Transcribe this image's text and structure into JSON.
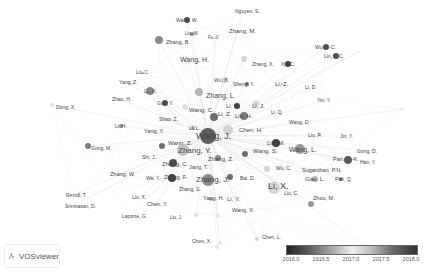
{
  "app": {
    "brand": "VOSviewer",
    "brand_icon": "vosviewer-logo-icon"
  },
  "legend": {
    "type": "overlay-color-scale",
    "ticks": [
      "2016.0",
      "2016.5",
      "2017.0",
      "2017.5",
      "2018.0"
    ],
    "colors": {
      "start": "#222222",
      "mid": "#eeeeee",
      "end": "#333333"
    }
  },
  "network": {
    "nodes": [
      {
        "label": "Nguyen, S.",
        "x": 230,
        "y": 11,
        "lx": 235,
        "ly": 11,
        "r": 0,
        "fs": 5,
        "c": "#999"
      },
      {
        "label": "Wang, W.",
        "x": 187,
        "y": 20,
        "lx": 176,
        "ly": 20,
        "r": 3,
        "fs": 5,
        "c": "#333"
      },
      {
        "label": "Zhang, M.",
        "x": 0,
        "y": 0,
        "lx": 229,
        "ly": 31,
        "r": 0,
        "fs": 6,
        "c": "#999"
      },
      {
        "label": "Liu, W.",
        "x": 192,
        "y": 34,
        "lx": 185,
        "ly": 34,
        "r": 2,
        "fs": 4.5,
        "c": "#777"
      },
      {
        "label": "Fu, Y.",
        "x": 216,
        "y": 38,
        "lx": 208,
        "ly": 38,
        "r": 1,
        "fs": 4.5,
        "c": "#999"
      },
      {
        "label": "Zhang, B.",
        "x": 159,
        "y": 40,
        "lx": 166,
        "ly": 43,
        "r": 4,
        "fs": 5.5,
        "c": "#777"
      },
      {
        "label": "Wang, H.",
        "x": 0,
        "y": 0,
        "lx": 180,
        "ly": 59,
        "r": 0,
        "fs": 7,
        "c": "#999"
      },
      {
        "label": "Wu, J.-C.",
        "x": 326,
        "y": 47,
        "lx": 315,
        "ly": 47,
        "r": 3,
        "fs": 5,
        "c": "#333"
      },
      {
        "label": "Lin, Y.-C.",
        "x": 336,
        "y": 56,
        "lx": 324,
        "ly": 56,
        "r": 3,
        "fs": 5,
        "c": "#333"
      },
      {
        "label": "Zhang, X.",
        "x": 244,
        "y": 59,
        "lx": 252,
        "ly": 64,
        "r": 3,
        "fs": 5,
        "c": "#ccc"
      },
      {
        "label": "Xu, C.",
        "x": 288,
        "y": 64,
        "lx": 281,
        "ly": 64,
        "r": 3,
        "fs": 5,
        "c": "#222"
      },
      {
        "label": "Liu, C.",
        "x": 143,
        "y": 73,
        "lx": 136,
        "ly": 73,
        "r": 1,
        "fs": 4.5,
        "c": "#999"
      },
      {
        "label": "Yang, Z.",
        "x": 0,
        "y": 0,
        "lx": 119,
        "ly": 82,
        "r": 0,
        "fs": 5,
        "c": "#999"
      },
      {
        "label": "Wu, X.",
        "x": 225,
        "y": 80,
        "lx": 214,
        "ly": 80,
        "r": 3,
        "fs": 5,
        "c": "#ccc"
      },
      {
        "label": "Sheng, Y.",
        "x": 247,
        "y": 84,
        "lx": 233,
        "ly": 84,
        "r": 2,
        "fs": 5,
        "c": "#555"
      },
      {
        "label": "Li, Z.",
        "x": 282,
        "y": 84,
        "lx": 275,
        "ly": 84,
        "r": 1,
        "fs": 6,
        "c": "#999"
      },
      {
        "label": "Li, D.",
        "x": 0,
        "y": 0,
        "lx": 305,
        "ly": 87,
        "r": 0,
        "fs": 5,
        "c": "#999"
      },
      {
        "label": "Li, K.",
        "x": 150,
        "y": 91,
        "lx": 144,
        "ly": 91,
        "r": 4,
        "fs": 6,
        "c": "#777"
      },
      {
        "label": "Zhang, L.",
        "x": 199,
        "y": 92,
        "lx": 206,
        "ly": 95,
        "r": 4,
        "fs": 7,
        "c": "#aaa"
      },
      {
        "label": "Zhao, H.",
        "x": 0,
        "y": 0,
        "lx": 112,
        "ly": 99,
        "r": 0,
        "fs": 5,
        "c": "#999"
      },
      {
        "label": "Dong, X.",
        "x": 52,
        "y": 105,
        "lx": 56,
        "ly": 107,
        "r": 2,
        "fs": 5,
        "c": "#ddd"
      },
      {
        "label": "Guo, Y.",
        "x": 165,
        "y": 103,
        "lx": 157,
        "ly": 103,
        "r": 3,
        "fs": 5,
        "c": "#333"
      },
      {
        "label": "Yin, Y.",
        "x": 0,
        "y": 0,
        "lx": 317,
        "ly": 100,
        "r": 0,
        "fs": 5,
        "c": "#999"
      },
      {
        "label": "Wang, C.",
        "x": 185,
        "y": 107,
        "lx": 189,
        "ly": 110,
        "r": 3,
        "fs": 6,
        "c": "#ddd"
      },
      {
        "label": "Li, X.",
        "x": 237,
        "y": 106,
        "lx": 226,
        "ly": 106,
        "r": 3,
        "fs": 6,
        "c": "#222"
      },
      {
        "label": "Li, J.",
        "x": 256,
        "y": 104,
        "lx": 252,
        "ly": 106,
        "r": 3,
        "fs": 6,
        "c": "#ccc"
      },
      {
        "label": "Li, Z.",
        "x": 214,
        "y": 117,
        "lx": 218,
        "ly": 114,
        "r": 4,
        "fs": 6,
        "c": "#555"
      },
      {
        "label": "Liu, H.",
        "x": 244,
        "y": 116,
        "lx": 235,
        "ly": 116,
        "r": 4,
        "fs": 6,
        "c": "#666"
      },
      {
        "label": "Li, Q.",
        "x": 0,
        "y": 0,
        "lx": 271,
        "ly": 112,
        "r": 0,
        "fs": 5,
        "c": "#999"
      },
      {
        "label": "Shao, Z.",
        "x": 0,
        "y": 0,
        "lx": 159,
        "ly": 119,
        "r": 0,
        "fs": 5,
        "c": "#999"
      },
      {
        "label": "Li, H.",
        "x": 121,
        "y": 126,
        "lx": 115,
        "ly": 126,
        "r": 2,
        "fs": 5,
        "c": "#777"
      },
      {
        "label": "Wang, D.",
        "x": 0,
        "y": 0,
        "lx": 289,
        "ly": 122,
        "r": 0,
        "fs": 5,
        "c": "#999"
      },
      {
        "label": "Li, L.",
        "x": 193,
        "y": 128,
        "lx": 189,
        "ly": 128,
        "r": 2,
        "fs": 5,
        "c": "#999"
      },
      {
        "label": "Chen, H.",
        "x": 228,
        "y": 130,
        "lx": 239,
        "ly": 130,
        "r": 5,
        "fs": 6,
        "c": "#ccc"
      },
      {
        "label": "Wang, J.",
        "x": 208,
        "y": 136,
        "lx": 196,
        "ly": 136,
        "r": 8,
        "fs": 9,
        "c": "#444"
      },
      {
        "label": "Yang, Y.",
        "x": 0,
        "y": 0,
        "lx": 144,
        "ly": 132,
        "r": 0,
        "fs": 5.5,
        "c": "#999"
      },
      {
        "label": "Liu, F.",
        "x": 320,
        "y": 135,
        "lx": 308,
        "ly": 135,
        "r": 1,
        "fs": 5,
        "c": "#999"
      },
      {
        "label": "Jin, Y.",
        "x": 0,
        "y": 0,
        "lx": 340,
        "ly": 136,
        "r": 0,
        "fs": 5,
        "c": "#999"
      },
      {
        "label": "Wang, Z.",
        "x": 162,
        "y": 146,
        "lx": 168,
        "ly": 143,
        "r": 3,
        "fs": 6,
        "c": "#555"
      },
      {
        "label": "Liu, M.",
        "x": 276,
        "y": 143,
        "lx": 267,
        "ly": 143,
        "r": 4,
        "fs": 6,
        "c": "#222"
      },
      {
        "label": "Gong, M.",
        "x": 88,
        "y": 146,
        "lx": 91,
        "ly": 148,
        "r": 3,
        "fs": 5,
        "c": "#666"
      },
      {
        "label": "Wang, L.",
        "x": 300,
        "y": 149,
        "lx": 289,
        "ly": 149,
        "r": 5,
        "fs": 7,
        "c": "#888"
      },
      {
        "label": "Zhang, Y.",
        "x": 183,
        "y": 150,
        "lx": 178,
        "ly": 151,
        "r": 6,
        "fs": 8,
        "c": "#bbb"
      },
      {
        "label": "Wang, S.",
        "x": 245,
        "y": 154,
        "lx": 253,
        "ly": 151,
        "r": 3,
        "fs": 6,
        "c": "#555"
      },
      {
        "label": "Gong, D.",
        "x": 0,
        "y": 0,
        "lx": 357,
        "ly": 151,
        "r": 0,
        "fs": 5,
        "c": "#999"
      },
      {
        "label": "Shi, J.",
        "x": 0,
        "y": 0,
        "lx": 142,
        "ly": 157,
        "r": 0,
        "fs": 5,
        "c": "#999"
      },
      {
        "label": "Pan, Q.-K.",
        "x": 348,
        "y": 160,
        "lx": 333,
        "ly": 160,
        "r": 4,
        "fs": 5.5,
        "c": "#444"
      },
      {
        "label": "Han, Y.",
        "x": 0,
        "y": 0,
        "lx": 360,
        "ly": 162,
        "r": 0,
        "fs": 5,
        "c": "#999"
      },
      {
        "label": "Zhang, Z.",
        "x": 218,
        "y": 158,
        "lx": 208,
        "ly": 159,
        "r": 3,
        "fs": 6,
        "c": "#777"
      },
      {
        "label": "Zhang, C.",
        "x": 173,
        "y": 163,
        "lx": 162,
        "ly": 164,
        "r": 4,
        "fs": 6,
        "c": "#333"
      },
      {
        "label": "Jiang, T.",
        "x": 0,
        "y": 0,
        "lx": 189,
        "ly": 167,
        "r": 0,
        "fs": 5,
        "c": "#999"
      },
      {
        "label": "Wu, C.",
        "x": 267,
        "y": 169,
        "lx": 276,
        "ly": 168,
        "r": 3,
        "fs": 5,
        "c": "#ccc"
      },
      {
        "label": "Suganthan, P.N.",
        "x": 0,
        "y": 0,
        "lx": 302,
        "ly": 171,
        "r": 0,
        "fs": 5.5,
        "c": "#999"
      },
      {
        "label": "Zhang, W.",
        "x": 0,
        "y": 0,
        "lx": 110,
        "ly": 175,
        "r": 0,
        "fs": 5.5,
        "c": "#999"
      },
      {
        "label": "Wu, Y.",
        "x": 152,
        "y": 178,
        "lx": 146,
        "ly": 178,
        "r": 1,
        "fs": 5,
        "c": "#999"
      },
      {
        "label": "Zhang, F.",
        "x": 172,
        "y": 178,
        "lx": 164,
        "ly": 178,
        "r": 4,
        "fs": 5.5,
        "c": "#222"
      },
      {
        "label": "Gao, L.",
        "x": 315,
        "y": 179,
        "lx": 305,
        "ly": 179,
        "r": 3,
        "fs": 6,
        "c": "#aaa"
      },
      {
        "label": "Pan, Q.",
        "x": 341,
        "y": 179,
        "lx": 335,
        "ly": 179,
        "r": 2,
        "fs": 5,
        "c": "#777"
      },
      {
        "label": "Zhang, J.",
        "x": 208,
        "y": 180,
        "lx": 196,
        "ly": 180,
        "r": 6,
        "fs": 8,
        "c": "#777"
      },
      {
        "label": "Bai, D.",
        "x": 230,
        "y": 177,
        "lx": 240,
        "ly": 178,
        "r": 3,
        "fs": 5,
        "c": "#555"
      },
      {
        "label": "Li, X.",
        "x": 274,
        "y": 188,
        "lx": 268,
        "ly": 186,
        "r": 6,
        "fs": 9,
        "c": "#ccc"
      },
      {
        "label": "Zhang, S.",
        "x": 0,
        "y": 0,
        "lx": 179,
        "ly": 189,
        "r": 0,
        "fs": 5,
        "c": "#999"
      },
      {
        "label": "Liu, C.",
        "x": 0,
        "y": 0,
        "lx": 284,
        "ly": 193,
        "r": 0,
        "fs": 5,
        "c": "#999"
      },
      {
        "label": "Reindl, T.",
        "x": 0,
        "y": 0,
        "lx": 66,
        "ly": 195,
        "r": 0,
        "fs": 5,
        "c": "#999"
      },
      {
        "label": "Liu, X.",
        "x": 0,
        "y": 0,
        "lx": 132,
        "ly": 197,
        "r": 0,
        "fs": 5,
        "c": "#999"
      },
      {
        "label": "Yang, H.",
        "x": 211,
        "y": 199,
        "lx": 203,
        "ly": 199,
        "r": 2,
        "fs": 5.5,
        "c": "#999"
      },
      {
        "label": "Li, Y.",
        "x": 0,
        "y": 0,
        "lx": 227,
        "ly": 199,
        "r": 0,
        "fs": 6,
        "c": "#999"
      },
      {
        "label": "Zhou, M.",
        "x": 311,
        "y": 204,
        "lx": 313,
        "ly": 199,
        "r": 3,
        "fs": 5.5,
        "c": "#888"
      },
      {
        "label": "Chen, Y.",
        "x": 0,
        "y": 0,
        "lx": 147,
        "ly": 205,
        "r": 0,
        "fs": 5.5,
        "c": "#999"
      },
      {
        "label": "Srinivasan, D.",
        "x": 0,
        "y": 0,
        "lx": 65,
        "ly": 206,
        "r": 0,
        "fs": 5,
        "c": "#999"
      },
      {
        "label": "Wang, X.",
        "x": 0,
        "y": 0,
        "lx": 232,
        "ly": 211,
        "r": 0,
        "fs": 5.5,
        "c": "#999"
      },
      {
        "label": "Laporte, G.",
        "x": 0,
        "y": 0,
        "lx": 122,
        "ly": 216,
        "r": 0,
        "fs": 5,
        "c": "#999"
      },
      {
        "label": "Liu, J.",
        "x": 196,
        "y": 215,
        "lx": 170,
        "ly": 218,
        "r": 2,
        "fs": 4.5,
        "c": "#ddd"
      },
      {
        "label": "Chen, X.",
        "x": 220,
        "y": 243,
        "lx": 192,
        "ly": 241,
        "r": 2,
        "fs": 5,
        "c": "#ddd"
      },
      {
        "label": "Chen, L.",
        "x": 257,
        "y": 239,
        "lx": 262,
        "ly": 237,
        "r": 2,
        "fs": 5,
        "c": "#ccc"
      },
      {
        "label": "",
        "x": 217,
        "y": 247,
        "lx": 0,
        "ly": 0,
        "r": 2,
        "fs": 0,
        "c": "#ddd"
      },
      {
        "label": "",
        "x": 365,
        "y": 245,
        "lx": 0,
        "ly": 0,
        "r": 1,
        "fs": 0,
        "c": "#ddd"
      },
      {
        "label": "",
        "x": 403,
        "y": 109,
        "lx": 0,
        "ly": 0,
        "r": 1,
        "fs": 0,
        "c": "#ddd"
      },
      {
        "label": "",
        "x": 358,
        "y": 52,
        "lx": 0,
        "ly": 0,
        "r": 1,
        "fs": 0,
        "c": "#ddd"
      },
      {
        "label": "",
        "x": 218,
        "y": 216,
        "lx": 0,
        "ly": 0,
        "r": 2,
        "fs": 0,
        "c": "#ddd"
      }
    ],
    "hub": {
      "x": 208,
      "y": 136
    }
  }
}
